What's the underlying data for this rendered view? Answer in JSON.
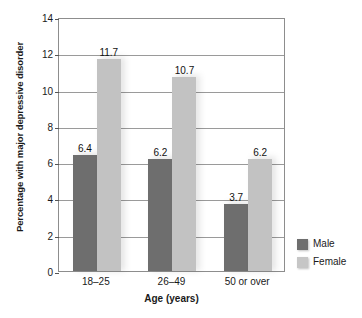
{
  "chart_data": {
    "type": "bar",
    "title": "",
    "subtitle": "",
    "xlabel": "Age (years)",
    "ylabel": "Percentage with major depressive disorder",
    "categories": [
      "18–25",
      "26–49",
      "50 or over"
    ],
    "series": [
      {
        "name": "Male",
        "color": "#6e6e6e",
        "values": [
          6.4,
          6.2,
          3.7
        ]
      },
      {
        "name": "Female",
        "color": "#c2c2c2",
        "values": [
          11.7,
          10.7,
          6.2
        ]
      }
    ],
    "value_labels": [
      "6.4",
      "11.7",
      "6.2",
      "10.7",
      "3.7",
      "6.2"
    ],
    "ylim": [
      0,
      14
    ],
    "ytick_step": 2,
    "yticks": [
      "0",
      "2",
      "4",
      "6",
      "8",
      "10",
      "12",
      "14"
    ],
    "grid": "horizontal",
    "legend_position": "right-bottom",
    "legend": [
      {
        "label": "Male",
        "color": "#6e6e6e"
      },
      {
        "label": "Female",
        "color": "#c6c6c6"
      }
    ]
  }
}
